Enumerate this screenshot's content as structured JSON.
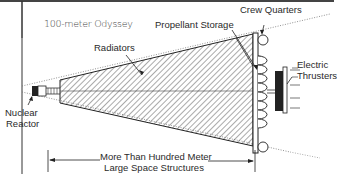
{
  "diagram": {
    "title": "100-meter Odyssey",
    "labels": {
      "radiators": "Radiators",
      "propellant_storage": "Propellant Storage",
      "crew_quarters": "Crew Quarters",
      "electric_thrusters_line1": "Electric",
      "electric_thrusters_line2": "Thrusters",
      "nuclear_reactor_line1": "Nuclear",
      "nuclear_reactor_line2": "Reactor",
      "dimension_line1": "More Than Hundred Meter",
      "dimension_line2": "Large Space Structures"
    },
    "colors": {
      "line": "#2a2a2a",
      "hatch": "#555555",
      "frame": "#333333",
      "background": "#ffffff"
    }
  }
}
